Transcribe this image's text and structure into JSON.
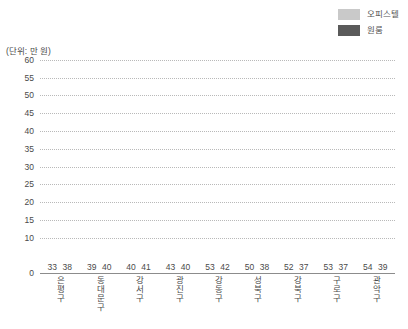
{
  "legend": {
    "position": "top-right",
    "items": [
      {
        "label": "오피스텔",
        "color": "#c9c9c9",
        "swatch_name": "officetel-swatch"
      },
      {
        "label": "원룸",
        "color": "#5a5a5a",
        "swatch_name": "oneroom-swatch"
      }
    ]
  },
  "unit_caption": "(단위: 만 원)",
  "chart_data": {
    "type": "bar",
    "title": "",
    "subtitle": "",
    "xlabel": "",
    "ylabel": "(단위: 만 원)",
    "ylim": [
      0,
      60
    ],
    "ytick_labels": [
      "60",
      "55",
      "50",
      "45",
      "40",
      "35",
      "30",
      "25",
      "20",
      "15",
      "10",
      "0"
    ],
    "ytick_values": [
      60,
      55,
      50,
      45,
      40,
      35,
      30,
      25,
      20,
      15,
      10,
      0
    ],
    "grid": "horizontal-dotted",
    "legend_position": "top-right",
    "categories": [
      "은평구",
      "동대문구",
      "강서구",
      "광진구",
      "강동구",
      "성북구",
      "강북구",
      "구로구",
      "관악구"
    ],
    "series": [
      {
        "name": "오피스텔",
        "color": "#c9c9c9",
        "values": [
          33,
          39,
          40,
          43,
          53,
          50,
          52,
          53,
          54
        ]
      },
      {
        "name": "원룸",
        "color": "#5a5a5a",
        "values": [
          38,
          40,
          41,
          40,
          42,
          38,
          37,
          37,
          39
        ]
      }
    ]
  }
}
